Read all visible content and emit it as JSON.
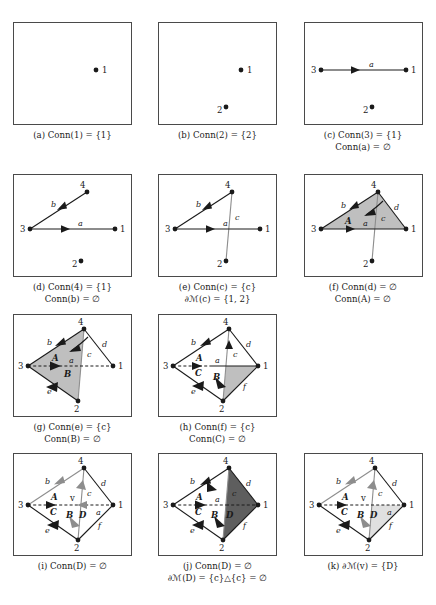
{
  "figure": {
    "title_visible": false,
    "rows": 4,
    "columns": 3,
    "panel_count": 11
  },
  "colors": {
    "ink": "#1a1a1a",
    "gray_edge": "#8d8d8d",
    "fill_light": "#bfbfbf",
    "fill_dark": "#5e5e5e",
    "fill_pale": "#e0e0e0",
    "panel_border": "#4a4a4a",
    "background": "#ffffff"
  },
  "vertex_labels": {
    "v1": "1",
    "v2": "2",
    "v3": "3",
    "v4": "4",
    "vv": "v"
  },
  "edge_labels": {
    "a": "a",
    "b": "b",
    "c": "c",
    "d": "d",
    "e": "e",
    "f": "f"
  },
  "face_labels": {
    "A": "A",
    "B": "B",
    "C": "C",
    "D": "D"
  },
  "panels": [
    {
      "id": "a",
      "tag": "(a)",
      "caption_lines": [
        "(a) Conn(1) = {1}"
      ],
      "caption_line1": "(a) Conn(1) = {1}",
      "caption_line2": "",
      "vertices": [
        "1"
      ],
      "edges": [],
      "faces": []
    },
    {
      "id": "b",
      "tag": "(b)",
      "caption_lines": [
        "(b) Conn(2) = {2}"
      ],
      "caption_line1": "(b) Conn(2) = {2}",
      "caption_line2": "",
      "vertices": [
        "1",
        "2"
      ],
      "edges": [],
      "faces": []
    },
    {
      "id": "c",
      "tag": "(c)",
      "caption_lines": [
        "(c) Conn(3) = {1}",
        "Conn(a) = ∅"
      ],
      "caption_line1": "(c) Conn(3) = {1}",
      "caption_line2": "Conn(a) = ∅",
      "vertices": [
        "1",
        "2",
        "3"
      ],
      "edges": [
        "a"
      ],
      "faces": []
    },
    {
      "id": "d",
      "tag": "(d)",
      "caption_lines": [
        "(d) Conn(4) = {1}",
        "Conn(b) = ∅"
      ],
      "caption_line1": "(d) Conn(4) = {1}",
      "caption_line2": "Conn(b) = ∅",
      "vertices": [
        "1",
        "2",
        "3",
        "4"
      ],
      "edges": [
        "a",
        "b"
      ],
      "faces": []
    },
    {
      "id": "e",
      "tag": "(e)",
      "caption_lines": [
        "(e) Conn(c) = {c}",
        "∂ℳ(c) = {1, 2}"
      ],
      "caption_line1": "(e) Conn(c) = {c}",
      "caption_line2": "∂ℳ(c) = {1, 2}",
      "vertices": [
        "1",
        "2",
        "3",
        "4"
      ],
      "edges": [
        "a",
        "b",
        "c"
      ],
      "faces": []
    },
    {
      "id": "f",
      "tag": "(f)",
      "caption_lines": [
        "(f) Conn(d) = ∅",
        "Conn(A) = ∅"
      ],
      "caption_line1": "(f) Conn(d) = ∅",
      "caption_line2": "Conn(A) = ∅",
      "vertices": [
        "1",
        "2",
        "3",
        "4"
      ],
      "edges": [
        "a",
        "b",
        "c",
        "d"
      ],
      "faces": [
        "A"
      ]
    },
    {
      "id": "g",
      "tag": "(g)",
      "caption_lines": [
        "(g) Conn(e) = {c}",
        "Conn(B) = ∅"
      ],
      "caption_line1": "(g) Conn(e) = {c}",
      "caption_line2": "Conn(B) = ∅",
      "vertices": [
        "1",
        "2",
        "3",
        "4"
      ],
      "edges": [
        "a",
        "b",
        "c",
        "d",
        "e"
      ],
      "faces": [
        "A",
        "B"
      ]
    },
    {
      "id": "h",
      "tag": "(h)",
      "caption_lines": [
        "(h) Conn(f) = {c}",
        "Conn(C) = ∅"
      ],
      "caption_line1": "(h) Conn(f) = {c}",
      "caption_line2": "Conn(C) = ∅",
      "vertices": [
        "1",
        "2",
        "3",
        "4"
      ],
      "edges": [
        "a",
        "b",
        "c",
        "d",
        "e",
        "f"
      ],
      "faces": [
        "A",
        "B",
        "C"
      ]
    },
    {
      "id": "i",
      "tag": "(i)",
      "caption_lines": [
        "(i) Conn(D) = ∅"
      ],
      "caption_line1": "(i) Conn(D) = ∅",
      "caption_line2": "",
      "vertices": [
        "1",
        "2",
        "3",
        "4",
        "v"
      ],
      "edges": [
        "a",
        "b",
        "c",
        "d",
        "e",
        "f"
      ],
      "faces": [
        "A",
        "B",
        "C",
        "D"
      ]
    },
    {
      "id": "j",
      "tag": "(j)",
      "caption_lines": [
        "(j) Conn(D) = ∅",
        "∂ℳ(D) = {c}△{c} = ∅"
      ],
      "caption_line1": "(j) Conn(D) = ∅",
      "caption_line2": "∂ℳ(D) = {c}△{c} = ∅",
      "vertices": [
        "1",
        "2",
        "3",
        "4"
      ],
      "edges": [
        "a",
        "b",
        "c",
        "d",
        "e",
        "f"
      ],
      "faces": [
        "A",
        "B",
        "C",
        "D"
      ]
    },
    {
      "id": "k",
      "tag": "(k)",
      "caption_lines": [
        "(k) ∂ℳ(v) = {D}"
      ],
      "caption_line1": "(k) ∂ℳ(v) = {D}",
      "caption_line2": "",
      "vertices": [
        "1",
        "2",
        "3",
        "4",
        "v"
      ],
      "edges": [
        "a",
        "b",
        "c",
        "d",
        "e",
        "f"
      ],
      "faces": [
        "A",
        "B",
        "C",
        "D"
      ]
    }
  ],
  "geometry": {
    "note": "normalized node positions inside each 117x101 panel viewport",
    "nodes": {
      "n1": [
        100,
        50
      ],
      "n2": [
        58,
        91
      ],
      "n3": [
        14,
        50
      ],
      "n4": [
        58,
        11
      ]
    },
    "lone": {
      "p1": [
        82,
        47
      ],
      "p2": [
        67,
        84
      ]
    }
  }
}
